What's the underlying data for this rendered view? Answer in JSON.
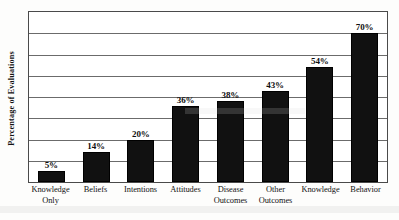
{
  "chart_data": {
    "type": "bar",
    "title": "",
    "subtitle": "",
    "xlabel": "",
    "ylabel": "Percentage of Evaluations",
    "ylim": [
      0,
      80
    ],
    "y_tick_labels": [],
    "gridlines": [
      10,
      20,
      30,
      40,
      50,
      60,
      70,
      80
    ],
    "grid": true,
    "legend": false,
    "legend_position": "none",
    "bar_color": "#111111",
    "categories": [
      "Knowledge Only",
      "Beliefs",
      "Intentions",
      "Attitudes",
      "Disease Outcomes",
      "Other Outcomes",
      "Knowledge",
      "Behavior"
    ],
    "category_lines": [
      [
        "Knowledge",
        "Only"
      ],
      [
        "Beliefs",
        ""
      ],
      [
        "Intentions",
        ""
      ],
      [
        "Attitudes",
        ""
      ],
      [
        "Disease",
        "Outcomes"
      ],
      [
        "Other",
        "Outcomes"
      ],
      [
        "Knowledge",
        ""
      ],
      [
        "Behavior",
        ""
      ]
    ],
    "values": [
      5,
      14,
      20,
      36,
      38,
      43,
      54,
      70
    ],
    "data_labels": [
      "5%",
      "14%",
      "20%",
      "36%",
      "38%",
      "43%",
      "54%",
      "70%"
    ]
  }
}
